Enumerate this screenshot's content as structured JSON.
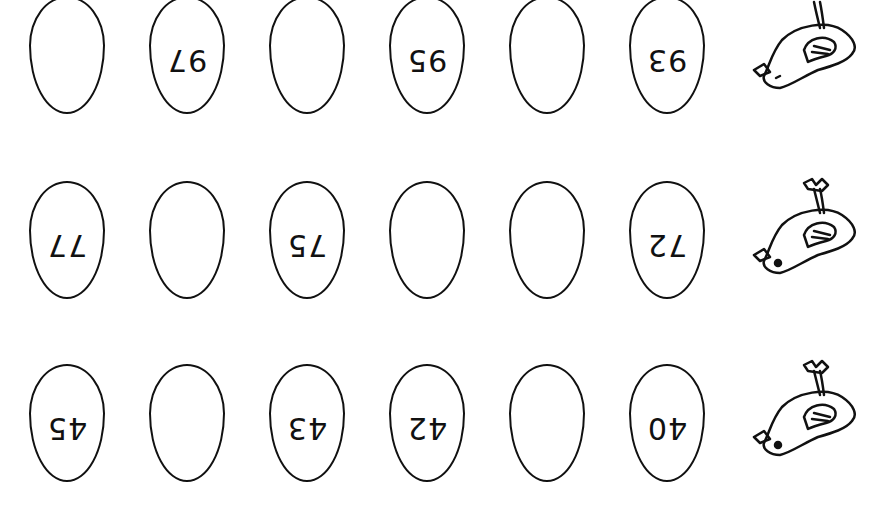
{
  "worksheet": {
    "orientation": "rotated-180",
    "rows": [
      {
        "eggs": [
          {
            "value": ""
          },
          {
            "value": "97"
          },
          {
            "value": ""
          },
          {
            "value": "95"
          },
          {
            "value": ""
          },
          {
            "value": "93"
          }
        ],
        "bird": "chick-icon"
      },
      {
        "eggs": [
          {
            "value": "77"
          },
          {
            "value": ""
          },
          {
            "value": "75"
          },
          {
            "value": ""
          },
          {
            "value": ""
          },
          {
            "value": "72"
          }
        ],
        "bird": "chick-icon"
      },
      {
        "eggs": [
          {
            "value": "45"
          },
          {
            "value": ""
          },
          {
            "value": "43"
          },
          {
            "value": "42"
          },
          {
            "value": ""
          },
          {
            "value": "40"
          }
        ],
        "bird": "chick-icon"
      }
    ]
  }
}
